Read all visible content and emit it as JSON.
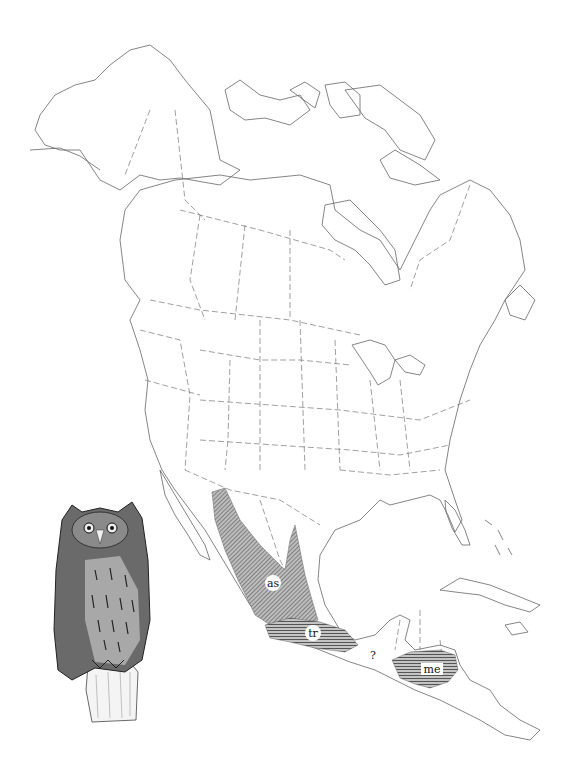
{
  "figure": {
    "type": "species-range-map",
    "region": "North America",
    "background_color": "#ffffff",
    "line_color": "#555555",
    "range_fill_color": "#8a8a8a"
  },
  "range_labels": [
    {
      "id": "as",
      "text": "as",
      "x": 273,
      "y": 587
    },
    {
      "id": "tr",
      "text": "tr",
      "x": 313,
      "y": 637
    },
    {
      "id": "me",
      "text": "me",
      "x": 432,
      "y": 671
    }
  ],
  "uncertain_marker": {
    "text": "?",
    "x": 373,
    "y": 657
  },
  "illustration": {
    "subject": "owl",
    "description": "screech owl perched on stump"
  }
}
